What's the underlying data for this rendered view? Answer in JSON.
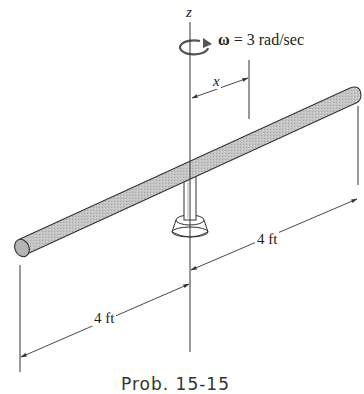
{
  "figure": {
    "axis_label": "z",
    "angular_velocity": {
      "symbol": "ω",
      "equals": " = ",
      "value": "3 rad/sec",
      "full_text": "ω = 3 rad/sec"
    },
    "position_variable": "x",
    "dimensions": [
      {
        "id": "right-length",
        "label": "4 ft"
      },
      {
        "id": "left-length",
        "label": "4 ft"
      }
    ],
    "caption": "Prob. 15-15"
  },
  "colors": {
    "rod_fill": "#bdbdbd",
    "line": "#333333",
    "background": "#ffffff"
  }
}
